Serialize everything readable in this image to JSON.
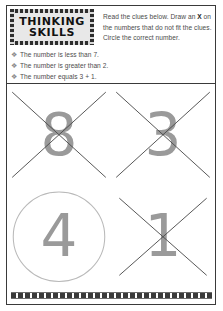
{
  "worksheet": {
    "badge": {
      "line1": "THINKING",
      "line2": "SKILLS"
    },
    "instructions": {
      "part1": "Read the clues below. Draw an ",
      "emphasis": "X",
      "part2": " on the numbers that do not fit the clues. Circle the correct number."
    },
    "clues": [
      {
        "bullet": "❖",
        "text": "The number is less than 7."
      },
      {
        "bullet": "❖",
        "text": "The number is greater than 2."
      },
      {
        "bullet": "❖",
        "text": "The number equals 3 + 1."
      }
    ],
    "numbers": [
      {
        "value": "8",
        "mark": "cross"
      },
      {
        "value": "3",
        "mark": "cross"
      },
      {
        "value": "4",
        "mark": "circle"
      },
      {
        "value": "1",
        "mark": "cross"
      }
    ],
    "colors": {
      "digit": "#9a9a9a",
      "mark": "#4a4a4a",
      "circle": "#b9b9b9",
      "text": "#4d4d4d",
      "border": "#3a3a3a",
      "badge_fill": "#e8e8e8"
    }
  }
}
